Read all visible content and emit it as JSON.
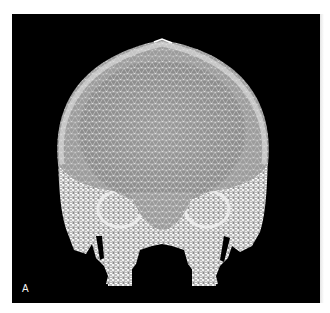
{
  "figure": {
    "panel_label": "A",
    "colors": {
      "background": "#000000",
      "mesh": "#e6e6e6",
      "cranium_fill": "#8a8a8a",
      "page": "#ffffff"
    }
  }
}
